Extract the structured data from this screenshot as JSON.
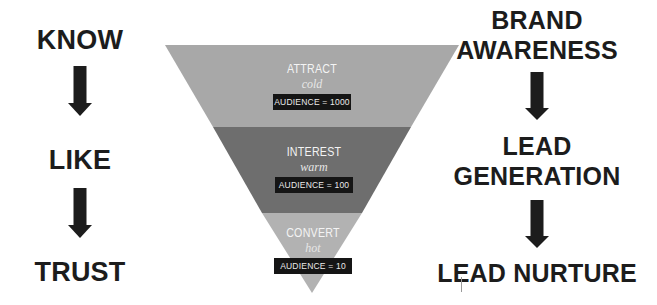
{
  "colors": {
    "attract": "#a8a8a8",
    "interest": "#6e6e6e",
    "convert": "#b2b2b2",
    "text_dark": "#1c1c1c",
    "audience_box": "#151515"
  },
  "left_column": {
    "items": [
      "KNOW",
      "LIKE",
      "TRUST"
    ],
    "arrows": [
      "down-arrow",
      "down-arrow"
    ]
  },
  "right_column": {
    "items": [
      {
        "line1": "BRAND",
        "line2": "AWARENESS"
      },
      {
        "line1": "LEAD",
        "line2": "GENERATION"
      },
      {
        "line1": "LEAD NURTURE"
      }
    ],
    "arrows": [
      "down-arrow",
      "down-arrow"
    ]
  },
  "funnel": {
    "stages": [
      {
        "title": "ATTRACT",
        "temperature": "cold",
        "audience": "AUDIENCE = 1000"
      },
      {
        "title": "INTEREST",
        "temperature": "warm",
        "audience": "AUDIENCE = 100"
      },
      {
        "title": "CONVERT",
        "temperature": "hot",
        "audience": "AUDIENCE = 10"
      }
    ]
  }
}
